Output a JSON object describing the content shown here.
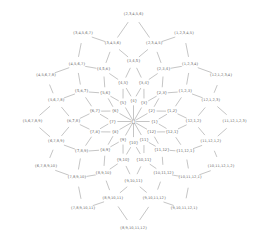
{
  "figure": {
    "kind": "lattice-hasse-diagram",
    "width": 269,
    "height": 245,
    "background_color": "#ffffff",
    "text_color": "#6b6b6b",
    "edge_color": "#8a8a8a",
    "center": {
      "x": 133.5,
      "y": 121.5
    },
    "ring_radii": [
      0,
      21,
      40,
      60,
      80,
      101
    ]
  },
  "chart_data": {
    "type": "diagram",
    "xlabel": "",
    "ylabel": "",
    "node_count": 61,
    "edge_count": 120,
    "nodes": [
      {
        "id": "n0",
        "label": "{}",
        "ring": 0,
        "angle": 0,
        "x": 133.5,
        "y": 121.5
      },
      {
        "id": "r1_1",
        "label": "{1}",
        "ring": 1,
        "angle": 0,
        "x": 154.5,
        "y": 121.5
      },
      {
        "id": "r1_2",
        "label": "{2}",
        "ring": 1,
        "angle": 30,
        "x": 151.7,
        "y": 111.0
      },
      {
        "id": "r1_3",
        "label": "{3}",
        "ring": 1,
        "angle": 60,
        "x": 144.0,
        "y": 103.3
      },
      {
        "id": "r1_4",
        "label": "{4}",
        "ring": 1,
        "angle": 90,
        "x": 133.5,
        "y": 100.5
      },
      {
        "id": "r1_5",
        "label": "{5}",
        "ring": 1,
        "angle": 120,
        "x": 123.0,
        "y": 103.3
      },
      {
        "id": "r1_6",
        "label": "{6}",
        "ring": 1,
        "angle": 150,
        "x": 115.3,
        "y": 111.0
      },
      {
        "id": "r1_7",
        "label": "{7}",
        "ring": 1,
        "angle": 180,
        "x": 112.5,
        "y": 121.5
      },
      {
        "id": "r1_8",
        "label": "{8}",
        "ring": 1,
        "angle": 210,
        "x": 115.3,
        "y": 132.0
      },
      {
        "id": "r1_9",
        "label": "{9}",
        "ring": 1,
        "angle": 240,
        "x": 123.0,
        "y": 139.7
      },
      {
        "id": "r1_10",
        "label": "{10}",
        "ring": 1,
        "angle": 270,
        "x": 133.5,
        "y": 142.5
      },
      {
        "id": "r1_11",
        "label": "{11}",
        "ring": 1,
        "angle": 300,
        "x": 144.0,
        "y": 139.7
      },
      {
        "id": "r1_12",
        "label": "{12}",
        "ring": 1,
        "angle": 330,
        "x": 151.7,
        "y": 132.0
      },
      {
        "id": "r2_1",
        "label": "{1,2}",
        "ring": 2,
        "angle": 15,
        "x": 172.1,
        "y": 111.2
      },
      {
        "id": "r2_2",
        "label": "{2,3}",
        "ring": 2,
        "angle": 45,
        "x": 161.8,
        "y": 93.2
      },
      {
        "id": "r2_3",
        "label": "{3,4}",
        "ring": 2,
        "angle": 75,
        "x": 143.9,
        "y": 82.9
      },
      {
        "id": "r2_4",
        "label": "{4,5}",
        "ring": 2,
        "angle": 105,
        "x": 123.1,
        "y": 82.9
      },
      {
        "id": "r2_5",
        "label": "{5,6}",
        "ring": 2,
        "angle": 135,
        "x": 105.2,
        "y": 93.2
      },
      {
        "id": "r2_6",
        "label": "{6,7}",
        "ring": 2,
        "angle": 165,
        "x": 94.9,
        "y": 111.2
      },
      {
        "id": "r2_7",
        "label": "{7,8}",
        "ring": 2,
        "angle": 195,
        "x": 94.9,
        "y": 131.8
      },
      {
        "id": "r2_8",
        "label": "{8,9}",
        "ring": 2,
        "angle": 225,
        "x": 105.2,
        "y": 149.8
      },
      {
        "id": "r2_9",
        "label": "{9,10}",
        "ring": 2,
        "angle": 255,
        "x": 123.1,
        "y": 160.1
      },
      {
        "id": "r2_10",
        "label": "{10,11}",
        "ring": 2,
        "angle": 285,
        "x": 143.9,
        "y": 160.1
      },
      {
        "id": "r2_11",
        "label": "{11,12}",
        "ring": 2,
        "angle": 315,
        "x": 161.8,
        "y": 149.8
      },
      {
        "id": "r2_12",
        "label": "{12,1}",
        "ring": 2,
        "angle": 345,
        "x": 172.1,
        "y": 131.8
      },
      {
        "id": "r3_1",
        "label": "{1,2,3}",
        "ring": 3,
        "angle": 30,
        "x": 185.4,
        "y": 91.5
      },
      {
        "id": "r3_2",
        "label": "{2,3,4}",
        "ring": 3,
        "angle": 60,
        "x": 163.5,
        "y": 69.5
      },
      {
        "id": "r3_3",
        "label": "{3,4,5}",
        "ring": 3,
        "angle": 90,
        "x": 133.5,
        "y": 61.5
      },
      {
        "id": "r3_4",
        "label": "{4,5,6}",
        "ring": 3,
        "angle": 120,
        "x": 103.5,
        "y": 69.5
      },
      {
        "id": "r3_5",
        "label": "{5,6,7}",
        "ring": 3,
        "angle": 150,
        "x": 81.6,
        "y": 91.5
      },
      {
        "id": "r3_6",
        "label": "{6,7,8}",
        "ring": 3,
        "angle": 180,
        "x": 73.5,
        "y": 121.5
      },
      {
        "id": "r3_7",
        "label": "{7,8,9}",
        "ring": 3,
        "angle": 210,
        "x": 81.6,
        "y": 151.5
      },
      {
        "id": "r3_8",
        "label": "{8,9,10}",
        "ring": 3,
        "angle": 240,
        "x": 103.5,
        "y": 173.5
      },
      {
        "id": "r3_9",
        "label": "{9,10,11}",
        "ring": 3,
        "angle": 270,
        "x": 133.5,
        "y": 181.5
      },
      {
        "id": "r3_10",
        "label": "{10,11,12}",
        "ring": 3,
        "angle": 300,
        "x": 163.5,
        "y": 173.5
      },
      {
        "id": "r3_11",
        "label": "{11,12,1}",
        "ring": 3,
        "angle": 330,
        "x": 185.4,
        "y": 151.5
      },
      {
        "id": "r3_12",
        "label": "{12,1,2}",
        "ring": 3,
        "angle": 0,
        "x": 193.5,
        "y": 121.5
      },
      {
        "id": "r4_1",
        "label": "{1,2,3,4}",
        "ring": 4,
        "angle": 45,
        "x": 190.1,
        "y": 64.9
      },
      {
        "id": "r4_2",
        "label": "{2,3,4,5}",
        "ring": 4,
        "angle": 75,
        "x": 154.2,
        "y": 44.2
      },
      {
        "id": "r4_3",
        "label": "{3,4,5,6}",
        "ring": 4,
        "angle": 105,
        "x": 112.8,
        "y": 44.2
      },
      {
        "id": "r4_4",
        "label": "{4,5,6,7}",
        "ring": 4,
        "angle": 135,
        "x": 76.9,
        "y": 64.9
      },
      {
        "id": "r4_5",
        "label": "{5,6,7,8}",
        "ring": 4,
        "angle": 165,
        "x": 56.2,
        "y": 100.8
      },
      {
        "id": "r4_6",
        "label": "{6,7,8,9}",
        "ring": 4,
        "angle": 195,
        "x": 56.2,
        "y": 142.2
      },
      {
        "id": "r4_7",
        "label": "{7,8,9,10}",
        "ring": 4,
        "angle": 225,
        "x": 76.9,
        "y": 178.1
      },
      {
        "id": "r4_8",
        "label": "{8,9,10,11}",
        "ring": 4,
        "angle": 255,
        "x": 112.8,
        "y": 198.8
      },
      {
        "id": "r4_9",
        "label": "{9,10,11,12}",
        "ring": 4,
        "angle": 285,
        "x": 154.2,
        "y": 198.8
      },
      {
        "id": "r4_10",
        "label": "{10,11,12,1}",
        "ring": 4,
        "angle": 315,
        "x": 190.1,
        "y": 178.1
      },
      {
        "id": "r4_11",
        "label": "{11,12,1,2}",
        "ring": 4,
        "angle": 345,
        "x": 210.8,
        "y": 142.2
      },
      {
        "id": "r4_12",
        "label": "{12,1,2,3}",
        "ring": 4,
        "angle": 15,
        "x": 210.8,
        "y": 100.8
      },
      {
        "id": "r5_1",
        "label": "{1,2,3,4,5}",
        "ring": 5,
        "angle": 60,
        "x": 184.0,
        "y": 34.0
      },
      {
        "id": "r5_2",
        "label": "{2,3,4,5,6}",
        "ring": 5,
        "angle": 90,
        "x": 133.5,
        "y": 14.5
      },
      {
        "id": "r5_3",
        "label": "{3,4,5,6,7}",
        "ring": 5,
        "angle": 120,
        "x": 83.0,
        "y": 34.0
      },
      {
        "id": "r5_4",
        "label": "{4,5,6,7,8}",
        "ring": 5,
        "angle": 150,
        "x": 46.0,
        "y": 76.0
      },
      {
        "id": "r5_5",
        "label": "{5,6,7,8,9}",
        "ring": 5,
        "angle": 180,
        "x": 32.5,
        "y": 121.5
      },
      {
        "id": "r5_6",
        "label": "{6,7,8,9,10}",
        "ring": 5,
        "angle": 210,
        "x": 46.0,
        "y": 167.0
      },
      {
        "id": "r5_7",
        "label": "{7,8,9,10,11}",
        "ring": 5,
        "angle": 240,
        "x": 83.0,
        "y": 209.0
      },
      {
        "id": "r5_8",
        "label": "{8,9,10,11,12}",
        "ring": 5,
        "angle": 270,
        "x": 133.5,
        "y": 229.0
      },
      {
        "id": "r5_9",
        "label": "{9,10,11,12,1}",
        "ring": 5,
        "angle": 300,
        "x": 184.0,
        "y": 209.0
      },
      {
        "id": "r5_10",
        "label": "{10,11,12,1,2}",
        "ring": 5,
        "angle": 330,
        "x": 221.0,
        "y": 167.0
      },
      {
        "id": "r5_11",
        "label": "{11,12,1,2,3}",
        "ring": 5,
        "angle": 0,
        "x": 234.5,
        "y": 121.5
      },
      {
        "id": "r5_12",
        "label": "{12,1,2,3,4}",
        "ring": 5,
        "angle": 30,
        "x": 221.0,
        "y": 76.0
      }
    ],
    "edges": [
      [
        "n0",
        "r1_1"
      ],
      [
        "n0",
        "r1_2"
      ],
      [
        "n0",
        "r1_3"
      ],
      [
        "n0",
        "r1_4"
      ],
      [
        "n0",
        "r1_5"
      ],
      [
        "n0",
        "r1_6"
      ],
      [
        "n0",
        "r1_7"
      ],
      [
        "n0",
        "r1_8"
      ],
      [
        "n0",
        "r1_9"
      ],
      [
        "n0",
        "r1_10"
      ],
      [
        "n0",
        "r1_11"
      ],
      [
        "n0",
        "r1_12"
      ],
      [
        "r1_1",
        "r2_1"
      ],
      [
        "r1_2",
        "r2_1"
      ],
      [
        "r1_2",
        "r2_2"
      ],
      [
        "r1_3",
        "r2_2"
      ],
      [
        "r1_3",
        "r2_3"
      ],
      [
        "r1_4",
        "r2_3"
      ],
      [
        "r1_4",
        "r2_4"
      ],
      [
        "r1_5",
        "r2_4"
      ],
      [
        "r1_5",
        "r2_5"
      ],
      [
        "r1_6",
        "r2_5"
      ],
      [
        "r1_6",
        "r2_6"
      ],
      [
        "r1_7",
        "r2_6"
      ],
      [
        "r1_7",
        "r2_7"
      ],
      [
        "r1_8",
        "r2_7"
      ],
      [
        "r1_8",
        "r2_8"
      ],
      [
        "r1_9",
        "r2_8"
      ],
      [
        "r1_9",
        "r2_9"
      ],
      [
        "r1_10",
        "r2_9"
      ],
      [
        "r1_10",
        "r2_10"
      ],
      [
        "r1_11",
        "r2_10"
      ],
      [
        "r1_11",
        "r2_11"
      ],
      [
        "r1_12",
        "r2_11"
      ],
      [
        "r1_12",
        "r2_12"
      ],
      [
        "r1_1",
        "r2_12"
      ],
      [
        "r2_1",
        "r3_1"
      ],
      [
        "r2_2",
        "r3_1"
      ],
      [
        "r2_2",
        "r3_2"
      ],
      [
        "r2_3",
        "r3_2"
      ],
      [
        "r2_3",
        "r3_3"
      ],
      [
        "r2_4",
        "r3_3"
      ],
      [
        "r2_4",
        "r3_4"
      ],
      [
        "r2_5",
        "r3_4"
      ],
      [
        "r2_5",
        "r3_5"
      ],
      [
        "r2_6",
        "r3_5"
      ],
      [
        "r2_6",
        "r3_6"
      ],
      [
        "r2_7",
        "r3_6"
      ],
      [
        "r2_7",
        "r3_7"
      ],
      [
        "r2_8",
        "r3_7"
      ],
      [
        "r2_8",
        "r3_8"
      ],
      [
        "r2_9",
        "r3_8"
      ],
      [
        "r2_9",
        "r3_9"
      ],
      [
        "r2_10",
        "r3_9"
      ],
      [
        "r2_10",
        "r3_10"
      ],
      [
        "r2_11",
        "r3_10"
      ],
      [
        "r2_11",
        "r3_11"
      ],
      [
        "r2_12",
        "r3_11"
      ],
      [
        "r2_12",
        "r3_12"
      ],
      [
        "r2_1",
        "r3_12"
      ],
      [
        "r3_1",
        "r4_1"
      ],
      [
        "r3_2",
        "r4_1"
      ],
      [
        "r3_2",
        "r4_2"
      ],
      [
        "r3_3",
        "r4_2"
      ],
      [
        "r3_3",
        "r4_3"
      ],
      [
        "r3_4",
        "r4_3"
      ],
      [
        "r3_4",
        "r4_4"
      ],
      [
        "r3_5",
        "r4_4"
      ],
      [
        "r3_5",
        "r4_5"
      ],
      [
        "r3_6",
        "r4_5"
      ],
      [
        "r3_6",
        "r4_6"
      ],
      [
        "r3_7",
        "r4_6"
      ],
      [
        "r3_7",
        "r4_7"
      ],
      [
        "r3_8",
        "r4_7"
      ],
      [
        "r3_8",
        "r4_8"
      ],
      [
        "r3_9",
        "r4_8"
      ],
      [
        "r3_9",
        "r4_9"
      ],
      [
        "r3_10",
        "r4_9"
      ],
      [
        "r3_10",
        "r4_10"
      ],
      [
        "r3_11",
        "r4_10"
      ],
      [
        "r3_11",
        "r4_11"
      ],
      [
        "r3_12",
        "r4_11"
      ],
      [
        "r3_12",
        "r4_12"
      ],
      [
        "r3_1",
        "r4_12"
      ],
      [
        "r4_1",
        "r5_1"
      ],
      [
        "r4_2",
        "r5_1"
      ],
      [
        "r4_2",
        "r5_2"
      ],
      [
        "r4_3",
        "r5_2"
      ],
      [
        "r4_3",
        "r5_3"
      ],
      [
        "r4_4",
        "r5_3"
      ],
      [
        "r4_4",
        "r5_4"
      ],
      [
        "r4_5",
        "r5_4"
      ],
      [
        "r4_5",
        "r5_5"
      ],
      [
        "r4_6",
        "r5_5"
      ],
      [
        "r4_6",
        "r5_6"
      ],
      [
        "r4_7",
        "r5_6"
      ],
      [
        "r4_7",
        "r5_7"
      ],
      [
        "r4_8",
        "r5_7"
      ],
      [
        "r4_8",
        "r5_8"
      ],
      [
        "r4_9",
        "r5_8"
      ],
      [
        "r4_9",
        "r5_9"
      ],
      [
        "r4_10",
        "r5_9"
      ],
      [
        "r4_10",
        "r5_10"
      ],
      [
        "r4_11",
        "r5_10"
      ],
      [
        "r4_11",
        "r5_11"
      ],
      [
        "r4_12",
        "r5_11"
      ],
      [
        "r4_12",
        "r5_12"
      ],
      [
        "r4_1",
        "r5_12"
      ]
    ]
  }
}
